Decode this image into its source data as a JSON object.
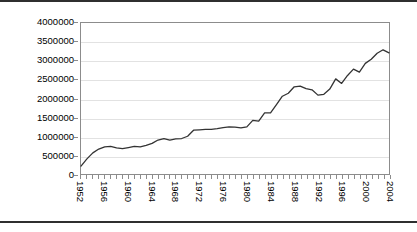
{
  "chart_data": {
    "type": "line",
    "title": "",
    "subtitle": "",
    "xlabel": "",
    "ylabel": "",
    "xlim": [
      1952,
      2004
    ],
    "ylim": [
      0,
      4000000
    ],
    "grid": true,
    "legend": false,
    "legend_position": "none",
    "line_color": "#333333",
    "y_ticks": [
      0,
      500000,
      1000000,
      1500000,
      2000000,
      2500000,
      3000000,
      3500000,
      4000000
    ],
    "y_tick_labels": [
      "0",
      "500000",
      "1000000",
      "1500000",
      "2000000",
      "2500000",
      "3000000",
      "3500000",
      "4000000"
    ],
    "x_tick_labels": [
      "1952",
      "1956",
      "1960",
      "1964",
      "1968",
      "1972",
      "1976",
      "1980",
      "1984",
      "1988",
      "1992",
      "1996",
      "2000",
      "2004"
    ],
    "x_tick_step": 4,
    "x": [
      1952,
      1953,
      1954,
      1955,
      1956,
      1957,
      1958,
      1959,
      1960,
      1961,
      1962,
      1963,
      1964,
      1965,
      1966,
      1967,
      1968,
      1969,
      1970,
      1971,
      1972,
      1973,
      1974,
      1975,
      1976,
      1977,
      1978,
      1979,
      1980,
      1981,
      1982,
      1983,
      1984,
      1985,
      1986,
      1987,
      1988,
      1989,
      1990,
      1991,
      1992,
      1993,
      1994,
      1995,
      1996,
      1997,
      1998,
      1999,
      2000,
      2001,
      2002,
      2003,
      2004
    ],
    "series": [
      {
        "name": "value",
        "values": [
          210000,
          400000,
          560000,
          660000,
          720000,
          730000,
          690000,
          670000,
          700000,
          730000,
          720000,
          760000,
          810000,
          900000,
          940000,
          900000,
          930000,
          940000,
          1000000,
          1160000,
          1170000,
          1180000,
          1180000,
          1200000,
          1230000,
          1250000,
          1240000,
          1220000,
          1250000,
          1420000,
          1400000,
          1620000,
          1620000,
          1840000,
          2060000,
          2140000,
          2310000,
          2330000,
          2260000,
          2230000,
          2090000,
          2110000,
          2250000,
          2520000,
          2400000,
          2610000,
          2780000,
          2700000,
          2930000,
          3040000,
          3200000,
          3290000,
          3210000
        ]
      }
    ]
  }
}
